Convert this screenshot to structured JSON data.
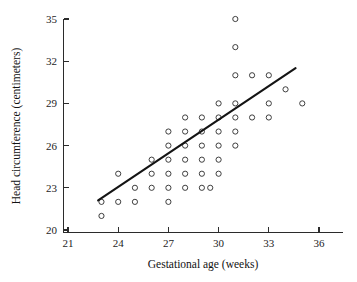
{
  "chart_data": {
    "type": "scatter",
    "title": "",
    "xlabel": "Gestational age (weeks)",
    "ylabel": "Head circumference (centimeters)",
    "xlim": [
      20.2,
      37.2
    ],
    "ylim": [
      19.6,
      35.6
    ],
    "xticks": [
      21,
      24,
      27,
      30,
      33,
      36
    ],
    "yticks": [
      20,
      23,
      26,
      29,
      32,
      35
    ],
    "xtick_labels": [
      "21",
      "24",
      "27",
      "30",
      "33",
      "36"
    ],
    "ytick_labels": [
      "20",
      "23",
      "26",
      "29",
      "32",
      "35"
    ],
    "grid": false,
    "legend": null,
    "marker": "open-circle",
    "marker_color": "#2a2a2a",
    "series": [
      {
        "name": "Low birth weight infants",
        "points": [
          [
            23,
            22
          ],
          [
            23,
            21
          ],
          [
            24,
            22
          ],
          [
            24,
            24
          ],
          [
            25,
            22
          ],
          [
            25,
            23
          ],
          [
            26,
            23
          ],
          [
            26,
            24
          ],
          [
            26,
            25
          ],
          [
            27,
            22
          ],
          [
            27,
            23
          ],
          [
            27,
            24
          ],
          [
            27,
            25
          ],
          [
            27,
            26
          ],
          [
            27,
            27
          ],
          [
            28,
            23
          ],
          [
            28,
            24
          ],
          [
            28,
            25
          ],
          [
            28,
            26
          ],
          [
            28,
            27
          ],
          [
            28,
            28
          ],
          [
            29,
            23
          ],
          [
            29,
            24
          ],
          [
            29,
            25
          ],
          [
            29,
            26
          ],
          [
            29,
            27
          ],
          [
            29,
            28
          ],
          [
            29.5,
            23
          ],
          [
            30,
            24
          ],
          [
            30,
            25
          ],
          [
            30,
            26
          ],
          [
            30,
            27
          ],
          [
            30,
            28
          ],
          [
            30,
            29
          ],
          [
            31,
            26
          ],
          [
            31,
            27
          ],
          [
            31,
            28
          ],
          [
            31,
            29
          ],
          [
            31,
            31
          ],
          [
            31,
            33
          ],
          [
            31,
            35
          ],
          [
            32,
            28
          ],
          [
            32,
            31
          ],
          [
            33,
            28
          ],
          [
            33,
            29
          ],
          [
            33,
            31
          ],
          [
            34,
            30
          ],
          [
            35,
            29
          ]
        ]
      }
    ],
    "fit_line": {
      "name": "least-squares regression line",
      "x_start": 22.8,
      "y_start": 22.1,
      "x_end": 34.6,
      "y_end": 31.5,
      "color": "#141414"
    }
  }
}
